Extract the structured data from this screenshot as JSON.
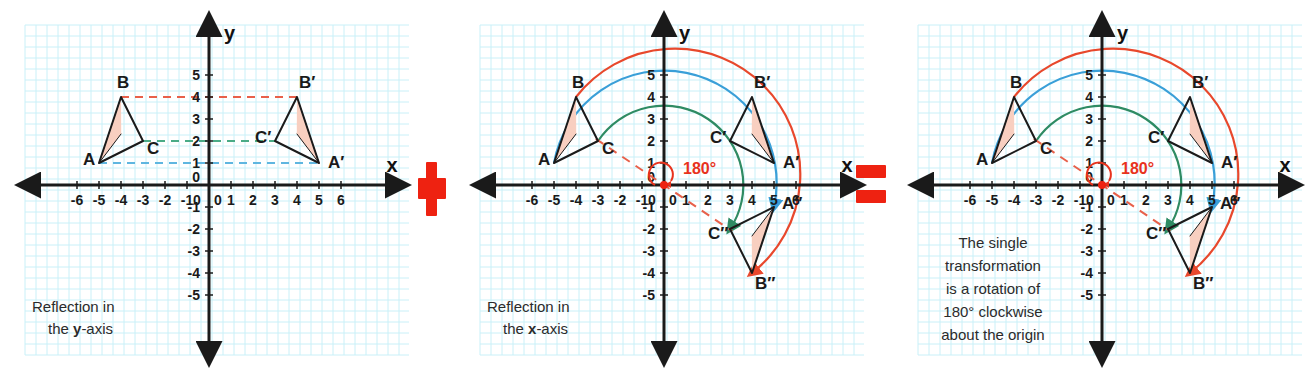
{
  "figure": {
    "colors": {
      "grid_minor": "#b9ecf5",
      "grid_major": "#7fdcef",
      "axis": "#1a1a1a",
      "shape_outline": "#1a1a1a",
      "shape_fill": "#f8cfc0",
      "arc_a": "#3a9fd8",
      "arc_b": "#e8482c",
      "arc_c": "#2e8b63",
      "dashed_red": "#e8604a",
      "dashed_green": "#4aab86",
      "dashed_blue": "#5fb6e0",
      "operator_red": "#ee2211",
      "text": "#2b2b2b",
      "degree_label": "#e8321c"
    },
    "axes": {
      "x_label": "x",
      "y_label": "y",
      "x_ticks": [
        "-6",
        "-5",
        "-4",
        "-3",
        "-2",
        "-1",
        "0",
        "1",
        "2",
        "3",
        "4",
        "5",
        "6"
      ],
      "y_ticks": [
        "5",
        "4",
        "3",
        "2",
        "1",
        "0",
        "-1",
        "-2",
        "-3",
        "-4",
        "-5"
      ],
      "origin_label": "0",
      "xlim": [
        -7,
        7
      ],
      "ylim": [
        -6,
        6
      ],
      "grid": true
    },
    "operators": {
      "plus": "+",
      "equals": "="
    },
    "panels": [
      {
        "id": "reflection-y-axis",
        "caption_line1": "Reflection in",
        "caption_line2_prefix": "the ",
        "caption_line2_bold": "y",
        "caption_line2_suffix": "-axis",
        "points": [
          {
            "label": "A",
            "x": -5,
            "y": 1
          },
          {
            "label": "B",
            "x": -4,
            "y": 4
          },
          {
            "label": "C",
            "x": -3,
            "y": 2
          },
          {
            "label": "A′",
            "x": 5,
            "y": 1
          },
          {
            "label": "B′",
            "x": 4,
            "y": 4
          },
          {
            "label": "C′",
            "x": 3,
            "y": 2
          }
        ],
        "triangles": [
          {
            "name": "ABC",
            "vertices": [
              [
                -5,
                1
              ],
              [
                -4,
                4
              ],
              [
                -3,
                2
              ]
            ]
          },
          {
            "name": "A'B'C'",
            "vertices": [
              [
                5,
                1
              ],
              [
                4,
                4
              ],
              [
                3,
                2
              ]
            ]
          }
        ],
        "connectors": [
          {
            "from": [
              -4,
              4
            ],
            "to": [
              4,
              4
            ],
            "color": "#e8604a"
          },
          {
            "from": [
              -3,
              2
            ],
            "to": [
              3,
              2
            ],
            "color": "#4aab86"
          },
          {
            "from": [
              -5,
              1
            ],
            "to": [
              5,
              1
            ],
            "color": "#5fb6e0"
          }
        ],
        "arcs": [],
        "rotation_label": null
      },
      {
        "id": "reflection-x-axis",
        "caption_line1": "Reflection in",
        "caption_line2_prefix": "the ",
        "caption_line2_bold": "x",
        "caption_line2_suffix": "-axis",
        "points": [
          {
            "label": "A",
            "x": -5,
            "y": 1
          },
          {
            "label": "B",
            "x": -4,
            "y": 4
          },
          {
            "label": "C",
            "x": -3,
            "y": 2
          },
          {
            "label": "A′",
            "x": 5,
            "y": 1
          },
          {
            "label": "B′",
            "x": 4,
            "y": 4
          },
          {
            "label": "C′",
            "x": 3,
            "y": 2
          },
          {
            "label": "A″",
            "x": 5,
            "y": -1
          },
          {
            "label": "B″",
            "x": 4,
            "y": -4
          },
          {
            "label": "C″",
            "x": 3,
            "y": -2
          }
        ],
        "triangles": [
          {
            "name": "ABC",
            "vertices": [
              [
                -5,
                1
              ],
              [
                -4,
                4
              ],
              [
                -3,
                2
              ]
            ]
          },
          {
            "name": "A'B'C'",
            "vertices": [
              [
                5,
                1
              ],
              [
                4,
                4
              ],
              [
                3,
                2
              ]
            ]
          },
          {
            "name": "A''B''C''",
            "vertices": [
              [
                5,
                -1
              ],
              [
                4,
                -4
              ],
              [
                3,
                -2
              ]
            ]
          }
        ],
        "connectors": [],
        "arcs": [
          {
            "name": "arc-B-to-Bdd",
            "color": "#e8482c",
            "radius": 5.7
          },
          {
            "name": "arc-A-to-Add",
            "color": "#3a9fd8",
            "radius": 5.1
          },
          {
            "name": "arc-C-to-Cdd",
            "color": "#2e8b63",
            "radius": 3.6
          }
        ],
        "rotation_label": "180°",
        "rotation_dashed_line": {
          "from": [
            -3.1,
            2.1
          ],
          "to": [
            3.1,
            -2.1
          ]
        }
      },
      {
        "id": "single-rotation",
        "caption_lines": [
          "The single",
          "transformation",
          "is a rotation of",
          "180° clockwise",
          "about the origin"
        ],
        "points": [
          {
            "label": "A",
            "x": -5,
            "y": 1
          },
          {
            "label": "B",
            "x": -4,
            "y": 4
          },
          {
            "label": "C",
            "x": -3,
            "y": 2
          },
          {
            "label": "A′",
            "x": 5,
            "y": 1
          },
          {
            "label": "B′",
            "x": 4,
            "y": 4
          },
          {
            "label": "C′",
            "x": 3,
            "y": 2
          },
          {
            "label": "A″",
            "x": 5,
            "y": -1
          },
          {
            "label": "B″",
            "x": 4,
            "y": -4
          },
          {
            "label": "C″",
            "x": 3,
            "y": -2
          }
        ],
        "triangles": [
          {
            "name": "ABC",
            "vertices": [
              [
                -5,
                1
              ],
              [
                -4,
                4
              ],
              [
                -3,
                2
              ]
            ]
          },
          {
            "name": "A'B'C'",
            "vertices": [
              [
                5,
                1
              ],
              [
                4,
                4
              ],
              [
                3,
                2
              ]
            ]
          },
          {
            "name": "A''B''C''",
            "vertices": [
              [
                5,
                -1
              ],
              [
                4,
                -4
              ],
              [
                3,
                -2
              ]
            ]
          }
        ],
        "connectors": [],
        "arcs": [
          {
            "name": "arc-B-to-Bdd",
            "color": "#e8482c",
            "radius": 5.7
          },
          {
            "name": "arc-A-to-Add",
            "color": "#3a9fd8",
            "radius": 5.1
          },
          {
            "name": "arc-C-to-Cdd",
            "color": "#2e8b63",
            "radius": 3.6
          }
        ],
        "rotation_label": "180°",
        "rotation_dashed_line": {
          "from": [
            -3.1,
            2.1
          ],
          "to": [
            3.1,
            -2.1
          ]
        }
      }
    ]
  }
}
